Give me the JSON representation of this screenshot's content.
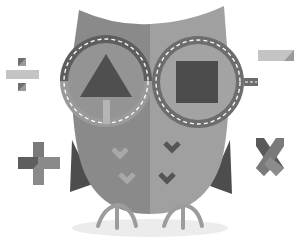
{
  "illustration": {
    "subject": "owl with glasses and math symbols",
    "caption": "Math owl illustration",
    "colors": {
      "background": "#ffffff",
      "owl_left": "#8a8a8a",
      "owl_right": "#a0a0a0",
      "wing_dark": "#4d4d4d",
      "rim_dark": "#5e5e5e",
      "rim_light": "#9a9a9a",
      "lens": "#949494",
      "lens_right": "#a3a3a3",
      "triangle": "#4f4f4f",
      "square": "#4c4c4c",
      "stem": "#b5b5b5",
      "dash": "#ffffff",
      "chevron_light": "#a8a8a8",
      "chevron_dark": "#555555",
      "legs": "#9c9c9c",
      "shadow": "#ececec"
    },
    "symbols": [
      {
        "name": "divide",
        "position": "left-top"
      },
      {
        "name": "minus",
        "position": "right-top"
      },
      {
        "name": "plus",
        "position": "left-bottom"
      },
      {
        "name": "times",
        "position": "right-bottom"
      }
    ],
    "lenses": [
      {
        "side": "left",
        "shape": "triangle"
      },
      {
        "side": "right",
        "shape": "square"
      }
    ],
    "chevrons": {
      "left_count": 2,
      "right_count": 2
    }
  }
}
